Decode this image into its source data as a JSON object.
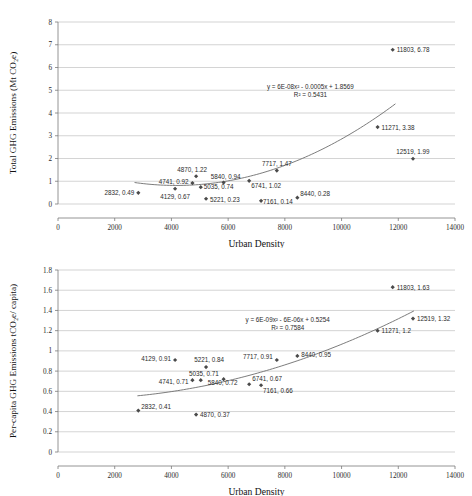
{
  "figures": [
    {
      "id": "total-ghg-emissions",
      "chart_data": {
        "type": "scatter",
        "title": "",
        "xlabel": "Urban Density",
        "ylabel": "Total GHG Emissions (Mt CO₂e)",
        "xlim": [
          0,
          14000
        ],
        "ylim": [
          0,
          8
        ],
        "xticks": [
          0,
          2000,
          4000,
          6000,
          8000,
          10000,
          12000,
          14000
        ],
        "xtick_labels": [
          "0",
          "2000",
          "4000",
          "6000",
          "8000",
          "10000",
          "12000",
          "14000"
        ],
        "yticks": [
          0,
          1,
          2,
          3,
          4,
          5,
          6,
          7,
          8
        ],
        "ytick_labels": [
          "0",
          "1",
          "2",
          "3",
          "4",
          "5",
          "6",
          "7",
          "8"
        ],
        "grid": "horizontal",
        "legend": "none",
        "points": [
          {
            "x": 2832,
            "y": 0.49,
            "label": "2832, 0.49",
            "anchor": "end",
            "dx": -4,
            "dy": 2.5
          },
          {
            "x": 4129,
            "y": 0.67,
            "label": "4129, 0.67",
            "anchor": "mid",
            "dx": 0,
            "dy": 10
          },
          {
            "x": 4741,
            "y": 0.92,
            "label": "4741, 0.92",
            "anchor": "end",
            "dx": -4,
            "dy": 1
          },
          {
            "x": 4870,
            "y": 1.22,
            "label": "4870, 1.22",
            "anchor": "mid",
            "dx": -4,
            "dy": -4
          },
          {
            "x": 5035,
            "y": 0.74,
            "label": "5035, 0.74",
            "anchor": "start",
            "dx": 3,
            "dy": 2
          },
          {
            "x": 5221,
            "y": 0.23,
            "label": "5221, 0.23",
            "anchor": "start",
            "dx": 4,
            "dy": 3
          },
          {
            "x": 5840,
            "y": 0.94,
            "label": "5840, 0.94",
            "anchor": "mid",
            "dx": 2,
            "dy": -4
          },
          {
            "x": 6741,
            "y": 1.02,
            "label": "6741, 1.02",
            "anchor": "start",
            "dx": 2,
            "dy": 7
          },
          {
            "x": 7161,
            "y": 0.14,
            "label": "7161, 0.14",
            "anchor": "start",
            "dx": 2,
            "dy": 3
          },
          {
            "x": 7717,
            "y": 1.47,
            "label": "7717, 1.47",
            "anchor": "mid",
            "dx": 0,
            "dy": -5
          },
          {
            "x": 8440,
            "y": 0.28,
            "label": "8440, 0.28",
            "anchor": "start",
            "dx": 3,
            "dy": -2
          },
          {
            "x": 11271,
            "y": 3.38,
            "label": "11271, 3.38",
            "anchor": "start",
            "dx": 4,
            "dy": 2.5
          },
          {
            "x": 11803,
            "y": 6.78,
            "label": "11803, 6.78",
            "anchor": "start",
            "dx": 4,
            "dy": 2.5
          },
          {
            "x": 12519,
            "y": 1.99,
            "label": "12519, 1.99",
            "anchor": "mid",
            "dx": 0,
            "dy": -5
          }
        ],
        "trendline": {
          "type": "polynomial-2",
          "a": 6e-08,
          "b": -0.0005,
          "c": 1.8569,
          "x_start": 2700,
          "x_end": 11900,
          "equation": "y = 6E-08x² - 0.0005x + 1.8569",
          "r_squared": "R² = 0.5431",
          "annotation_x": 8900,
          "annotation_y": 5.05
        }
      }
    },
    {
      "id": "per-capita-ghg-emissions",
      "chart_data": {
        "type": "scatter",
        "title": "",
        "xlabel": "Urban Density",
        "ylabel": "Per-capita GHG Emissions  tCO₂e/ capita)",
        "xlim": [
          0,
          14000
        ],
        "ylim": [
          0,
          1.8
        ],
        "xticks": [
          0,
          2000,
          4000,
          6000,
          8000,
          10000,
          12000,
          14000
        ],
        "xtick_labels": [
          "0",
          "2000",
          "4000",
          "6000",
          "8000",
          "10000",
          "12000",
          "14000"
        ],
        "yticks": [
          0,
          0.2,
          0.4,
          0.6,
          0.8,
          1,
          1.2,
          1.4,
          1.6,
          1.8
        ],
        "ytick_labels": [
          "0",
          "0.2",
          "0.4",
          "0.6",
          "0.8",
          "1",
          "1.2",
          "1.4",
          "1.6",
          "1.8"
        ],
        "grid": "horizontal",
        "legend": "none",
        "points": [
          {
            "x": 2832,
            "y": 0.41,
            "label": "2832, 0.41",
            "anchor": "start",
            "dx": 3,
            "dy": -2
          },
          {
            "x": 4129,
            "y": 0.91,
            "label": "4129, 0.91",
            "anchor": "end",
            "dx": -4,
            "dy": 1
          },
          {
            "x": 4741,
            "y": 0.71,
            "label": "4741, 0.71",
            "anchor": "end",
            "dx": -4,
            "dy": 4
          },
          {
            "x": 4870,
            "y": 0.37,
            "label": "4870, 0.37",
            "anchor": "start",
            "dx": 4,
            "dy": 2.5
          },
          {
            "x": 5035,
            "y": 0.71,
            "label": "5035, 0.71",
            "anchor": "mid",
            "dx": 3,
            "dy": -4
          },
          {
            "x": 5221,
            "y": 0.84,
            "label": "5221, 0.84",
            "anchor": "mid",
            "dx": 3,
            "dy": -5
          },
          {
            "x": 5840,
            "y": 0.72,
            "label": "5840, 0.72",
            "anchor": "mid",
            "dx": -1,
            "dy": 6
          },
          {
            "x": 6741,
            "y": 0.67,
            "label": "6741, 0.67",
            "anchor": "start",
            "dx": 3,
            "dy": -3
          },
          {
            "x": 7161,
            "y": 0.66,
            "label": "7161, 0.66",
            "anchor": "start",
            "dx": 2,
            "dy": 8
          },
          {
            "x": 7717,
            "y": 0.91,
            "label": "7717, 0.91",
            "anchor": "end",
            "dx": -4,
            "dy": -1
          },
          {
            "x": 8440,
            "y": 0.95,
            "label": "8440, 0.95",
            "anchor": "start",
            "dx": 4,
            "dy": 1
          },
          {
            "x": 11271,
            "y": 1.2,
            "label": "11271, 1.2",
            "anchor": "start",
            "dx": 4,
            "dy": 2.5
          },
          {
            "x": 11803,
            "y": 1.63,
            "label": "11803, 1.63",
            "anchor": "start",
            "dx": 4,
            "dy": 2.5
          },
          {
            "x": 12519,
            "y": 1.32,
            "label": "12519, 1.32",
            "anchor": "start",
            "dx": 4,
            "dy": 2.5
          }
        ],
        "trendline": {
          "type": "polynomial-2",
          "a": 6e-09,
          "b": -6e-06,
          "c": 0.5254,
          "x_start": 2800,
          "x_end": 12550,
          "equation": "y = 6E-09x² - 6E-06x + 0.5254",
          "r_squared": "R² = 0.7584",
          "annotation_x": 8100,
          "annotation_y": 1.285
        }
      }
    }
  ]
}
